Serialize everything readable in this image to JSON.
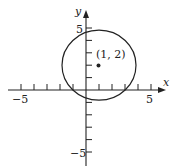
{
  "diagram": {
    "type": "circle-on-coordinate-plane",
    "axes": {
      "x_label": "x",
      "y_label": "y",
      "x_range": [
        -5,
        5
      ],
      "y_range": [
        -5,
        5
      ],
      "tick_labels": {
        "x_neg": "−5",
        "x_pos": "5",
        "y_pos": "5",
        "y_neg": "−5"
      }
    },
    "center": {
      "x": 1,
      "y": 2,
      "label": "(1, 2)"
    },
    "radius": 3,
    "colors": {
      "stroke": "#222222",
      "background": "#ffffff"
    }
  }
}
